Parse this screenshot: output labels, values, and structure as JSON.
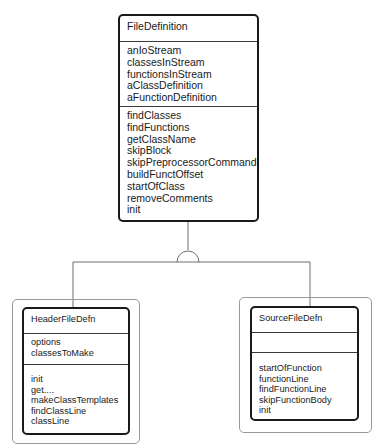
{
  "diagram": {
    "type": "uml-class-inheritance",
    "relationship": "generalization",
    "colors": {
      "box_border": "#1a1a1a",
      "frame_border": "#9a9a9a",
      "connector": "#6e6e6e",
      "background": "#ffffff"
    }
  },
  "classes": {
    "base": {
      "name": "FileDefinition",
      "attributes": [
        "anIoStream",
        "classesInStream",
        "functionsInStream",
        "aClassDefinition",
        "aFunctionDefinition"
      ],
      "methods": [
        "findClasses",
        "findFunctions",
        "getClassName",
        "skipBlock",
        "skipPreprocessorCommand",
        "buildFunctOffset",
        "startOfClass",
        "removeComments",
        "init"
      ]
    },
    "header": {
      "name": "HeaderFileDefn",
      "attributes": [
        "options",
        "classesToMake"
      ],
      "methods": [
        "init",
        "get....",
        "makeClassTemplates",
        "findClassLine",
        "classLine"
      ]
    },
    "source": {
      "name": "SourceFileDefn",
      "attributes": [],
      "methods": [
        "startOfFunction",
        "functionLine",
        "findFunctionLine",
        "skipFunctionBody",
        "init"
      ]
    }
  }
}
